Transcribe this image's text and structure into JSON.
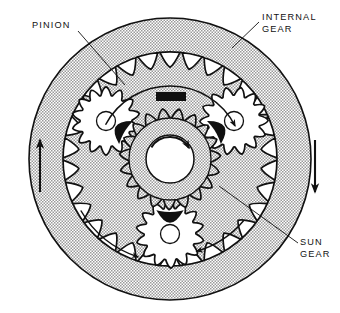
{
  "figure": {
    "kind": "technical-line-diagram",
    "background_color": "#ffffff",
    "line_color": "#111111",
    "shade_color": "#b9b9b9",
    "solid_fill_color": "#101010"
  },
  "labels": [
    {
      "id": "pinion",
      "lines": [
        "PINION"
      ],
      "text_x": 32,
      "text_y": 28,
      "anchor": "start",
      "leader": [
        [
          78,
          31
        ],
        [
          125,
          85
        ]
      ]
    },
    {
      "id": "internal-gear",
      "lines": [
        "INTERNAL",
        "GEAR"
      ],
      "text_x": 262,
      "text_y": 20,
      "anchor": "start",
      "leader": [
        [
          259,
          22
        ],
        [
          232,
          48
        ]
      ]
    },
    {
      "id": "sun-gear",
      "lines": [
        "SUN",
        "GEAR"
      ],
      "text_x": 300,
      "text_y": 245,
      "anchor": "start",
      "leader": [
        [
          298,
          243
        ],
        [
          219,
          186
        ]
      ]
    }
  ],
  "straight_arrows": [
    {
      "id": "left-up-arrow",
      "direction": "up",
      "x": 40,
      "y_tail": 192,
      "y_head": 140
    },
    {
      "id": "right-down-arrow",
      "direction": "down",
      "x": 315,
      "y_tail": 140,
      "y_head": 192
    }
  ],
  "curved_arrows": [
    {
      "id": "internal-gear-rotation-arrow",
      "direction": "clockwise",
      "radius": 73,
      "start_deg": 208,
      "end_deg": 333
    },
    {
      "id": "sun-gear-rotation-arrow",
      "direction": "clockwise",
      "radius": 22,
      "start_deg": 212,
      "end_deg": 330
    },
    {
      "id": "carrier-rotation-arrow-left",
      "direction": "counterclockwise",
      "radius": 103,
      "start_deg": 150,
      "end_deg": 108
    },
    {
      "id": "carrier-rotation-arrow-right",
      "direction": "clockwise",
      "radius": 96,
      "start_deg": 40,
      "end_deg": 74
    }
  ],
  "geometry": {
    "center": {
      "x": 170,
      "y": 159
    },
    "housing_outer_radius": 141,
    "internal_gear_ring_outer_radius": 141,
    "internal_gear_root_radius": 107,
    "internal_gear_tip_radius": 94,
    "internal_gear_teeth": 30,
    "sun_gear_tip_radius": 49,
    "sun_gear_root_radius": 41,
    "sun_gear_body_radius": 41,
    "sun_gear_bore_radius": 24,
    "sun_gear_teeth": 19,
    "pinion_tip_radius": 33,
    "pinion_root_radius": 26,
    "pinion_teeth": 14,
    "pinion_bore_radius": 9,
    "pinion_centers": [
      {
        "id": "pinion-upper-left",
        "x": 106,
        "y": 121,
        "angle_deg": 210
      },
      {
        "id": "pinion-upper-right",
        "x": 234,
        "y": 121,
        "angle_deg": 330
      },
      {
        "id": "pinion-bottom",
        "x": 170,
        "y": 234,
        "angle_deg": 90
      }
    ],
    "carrier": {
      "corner_radius": 26,
      "center_cutout_radius": 53,
      "top_tab": {
        "x": 156,
        "y": 92,
        "width": 30,
        "height": 9
      }
    }
  }
}
